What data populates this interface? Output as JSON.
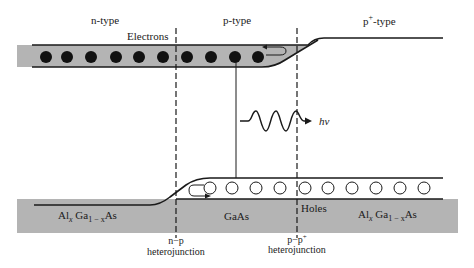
{
  "diagram": {
    "type": "energy-band-diagram",
    "regions": [
      {
        "label": "n-type",
        "material_prefix": "Al",
        "x_sub": "x",
        "mid": " Ga",
        "sub2": "1 − x",
        "suffix": "As"
      },
      {
        "label": "p-type",
        "material": "GaAs"
      },
      {
        "label_base": "p",
        "label_sup": "+",
        "label_suffix": "-type",
        "material_prefix": "Al",
        "x_sub": "x",
        "mid": " Ga",
        "sub2": "1 − x",
        "suffix": "As"
      }
    ],
    "carriers": {
      "electrons_label": "Electrons",
      "holes_label": "Holes",
      "electron_count": 10,
      "hole_count": 10
    },
    "photon_label": "hν",
    "junctions": [
      {
        "line1": "n−p",
        "line2": "heterojunction"
      },
      {
        "line1_base": "p−p",
        "line1_sup": "+",
        "line2": "heterojunction"
      }
    ],
    "colors": {
      "band_fill": "#b4b4b4",
      "line": "#1a1a1a",
      "background": "#ffffff"
    }
  }
}
